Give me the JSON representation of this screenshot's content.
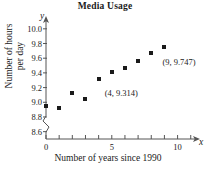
{
  "chart_data": {
    "type": "scatter",
    "title": "Media Usage",
    "xlabel": "Number of years since 1990",
    "ylabel_line1": "Number of hours",
    "ylabel_line2": "per day",
    "x_axis_var": "x",
    "y_axis_var": "y",
    "xlim": [
      0,
      11.4
    ],
    "ylim": [
      8.5,
      10.12
    ],
    "y_axis_break": true,
    "grid": false,
    "legend": null,
    "x_tick_labels": [
      "0",
      "5",
      "10"
    ],
    "x_tick_label_values": [
      0,
      5,
      10
    ],
    "x_minor_ticks": [
      1,
      2,
      3,
      4,
      6,
      7,
      8,
      9,
      11
    ],
    "y_tick_labels": [
      "10.0",
      "9.8",
      "9.6",
      "9.4",
      "9.2",
      "9.0",
      "8.8",
      "8.6"
    ],
    "y_tick_label_values": [
      10.0,
      9.8,
      9.6,
      9.4,
      9.2,
      9.0,
      8.8,
      8.6
    ],
    "x": [
      0,
      1,
      2,
      3,
      4,
      5,
      6,
      7,
      8,
      9
    ],
    "values": [
      8.95,
      8.92,
      9.12,
      9.05,
      9.314,
      9.41,
      9.47,
      9.56,
      9.67,
      9.747
    ],
    "marker": "square",
    "marker_color": "#1a1a1a",
    "annotations": [
      {
        "text": "(4, 9.314)",
        "point_x": 4,
        "point_y": 9.314
      },
      {
        "text": "(9, 9.747)",
        "point_x": 9,
        "point_y": 9.747
      }
    ]
  }
}
